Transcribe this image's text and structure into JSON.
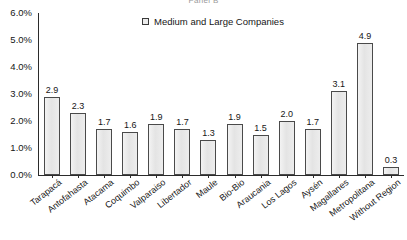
{
  "panel": {
    "title": "Panel B"
  },
  "legend": {
    "position": "top-center",
    "swatch_name": "legend-swatch-medium-large",
    "entries": [
      {
        "label": "Medium and Large Companies",
        "color": "#e9e9e9",
        "border": "#3a3a3a"
      }
    ]
  },
  "axes": {
    "y_ticks": [
      "0.0%",
      "1.0%",
      "2.0%",
      "3.0%",
      "4.0%",
      "5.0%",
      "6.0%"
    ],
    "y_min": 0.0,
    "y_max": 6.0,
    "y_step": 1.0,
    "grid": false
  },
  "chart_data": {
    "type": "bar",
    "title": "Panel B",
    "subtitle": "",
    "xlabel": "",
    "ylabel": "",
    "ylim": [
      0,
      6
    ],
    "ytick_labels": [
      "0.0%",
      "1.0%",
      "2.0%",
      "3.0%",
      "4.0%",
      "5.0%",
      "6.0%"
    ],
    "grid": false,
    "legend_position": "top-center",
    "series": [
      {
        "name": "Medium and Large Companies",
        "color": "#e9e9e9",
        "border_color": "#4a4a4a",
        "values": [
          2.9,
          2.3,
          1.7,
          1.6,
          1.9,
          1.7,
          1.3,
          1.9,
          1.5,
          2.0,
          1.7,
          3.1,
          4.9,
          0.3
        ]
      }
    ],
    "categories": [
      "Tarapacá",
      "Antofahasta",
      "Atacama",
      "Coquimbo",
      "Valparaiso",
      "Libertador",
      "Maule",
      "Bio-Bio",
      "Araucania",
      "Los Lagos",
      "Aysén",
      "Magallanes",
      "Metropolitana",
      "Without Region"
    ],
    "data_labels": [
      "2.9",
      "2.3",
      "1.7",
      "1.6",
      "1.9",
      "1.7",
      "1.3",
      "1.9",
      "1.5",
      "2.0",
      "1.7",
      "3.1",
      "4.9",
      "0.3"
    ]
  }
}
